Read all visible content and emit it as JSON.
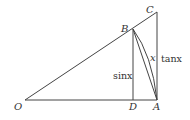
{
  "diagram": {
    "type": "geometry-unit-circle-triangle",
    "points": {
      "O": {
        "label": "O",
        "x": 25,
        "y": 100
      },
      "D": {
        "label": "D",
        "x": 133,
        "y": 100
      },
      "A": {
        "label": "A",
        "x": 157,
        "y": 100
      },
      "B": {
        "label": "B",
        "x": 133,
        "y": 29
      },
      "C": {
        "label": "C",
        "x": 157,
        "y": 12
      }
    },
    "segments": [
      "OA",
      "OC",
      "CA",
      "BD",
      "BA"
    ],
    "arc": {
      "from": "B",
      "to": "A",
      "label": "x"
    },
    "annotations": {
      "sin": "sinx",
      "tan": "tanx",
      "arc_label": "x"
    },
    "colors": {
      "line": "#444444",
      "text": "#333333",
      "background": "#ffffff"
    }
  }
}
